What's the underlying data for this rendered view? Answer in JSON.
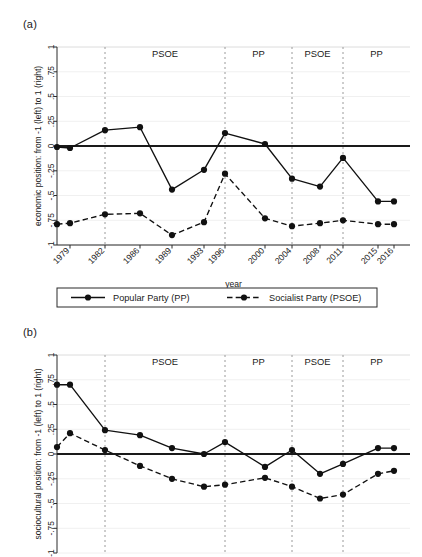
{
  "figure": {
    "panels": [
      {
        "tag": "(a)",
        "ylabel": "economic position: from -1 (left) to 1 (right)",
        "xlabel": "year"
      },
      {
        "tag": "(b)",
        "ylabel": "sociocultural position: from -1 (left) to 1 (right)",
        "xlabel": "year"
      }
    ],
    "legend": {
      "items": [
        {
          "label": "Popular Party (PP)",
          "style": "solid",
          "marker": "filled-circle"
        },
        {
          "label": "Socialist Party (PSOE)",
          "style": "dashed",
          "marker": "filled-circle"
        }
      ]
    },
    "colors": {
      "line": "#111111",
      "divider": "#9a9a9a",
      "zero": "#1a1a1a",
      "axis": "#2b2b2b"
    }
  },
  "chart_data": [
    {
      "type": "line",
      "title": "(a)",
      "xlabel": "year",
      "ylabel": "economic position: from -1 (left) to 1 (right)",
      "ylim": [
        -1,
        1
      ],
      "yticks": [
        -1,
        -0.75,
        -0.5,
        -0.25,
        0,
        0.25,
        0.5,
        0.75,
        1
      ],
      "yticklabels": [
        "-1",
        "-.75",
        "-.5",
        "-.25",
        "0",
        ".25",
        ".5",
        ".75",
        "1"
      ],
      "x": [
        1979,
        1982,
        1986,
        1989,
        1993,
        1996,
        2000,
        2004,
        2008,
        2011,
        2015,
        2016
      ],
      "xticklabels": [
        "1979",
        "1982",
        "1986",
        "1989",
        "1993",
        "1996",
        "2000",
        "2004",
        "2008",
        "2011",
        "2015",
        "2016"
      ],
      "grid": false,
      "legend_position": "below",
      "zero_line": true,
      "series": [
        {
          "name": "Popular Party (PP)",
          "style": "solid",
          "values": [
            -0.01,
            -0.02,
            0.16,
            0.19,
            -0.44,
            -0.24,
            0.13,
            0.02,
            -0.33,
            -0.41,
            -0.12,
            -0.56,
            -0.56
          ]
        },
        {
          "name": "Socialist Party (PSOE)",
          "style": "dashed",
          "values": [
            -0.79,
            -0.78,
            -0.69,
            -0.68,
            -0.9,
            -0.77,
            -0.28,
            -0.73,
            -0.81,
            -0.78,
            -0.75,
            -0.79,
            -0.79
          ]
        }
      ],
      "annotations": [
        {
          "text": "PSOE",
          "x_range": [
            1982,
            1996
          ]
        },
        {
          "text": "PP",
          "x_range": [
            1996,
            2004
          ]
        },
        {
          "text": "PSOE",
          "x_range": [
            2004,
            2011
          ]
        },
        {
          "text": "PP",
          "x_range": [
            2011,
            2016
          ]
        }
      ],
      "dividers": [
        1982,
        1996,
        2004,
        2011
      ]
    },
    {
      "type": "line",
      "title": "(b)",
      "xlabel": "year",
      "ylabel": "sociocultural position: from -1 (left) to 1 (right)",
      "ylim": [
        -1,
        1
      ],
      "yticks": [
        -1,
        -0.75,
        -0.5,
        -0.25,
        0,
        0.25,
        0.5,
        0.75,
        1
      ],
      "yticklabels": [
        "-1",
        "-.75",
        "-.5",
        "-.25",
        "0",
        ".25",
        ".5",
        ".75",
        "1"
      ],
      "x": [
        1979,
        1982,
        1986,
        1989,
        1993,
        1996,
        2000,
        2004,
        2008,
        2011,
        2015,
        2016
      ],
      "xticklabels": [
        "1979",
        "1982",
        "1986",
        "1989",
        "1993",
        "1996",
        "2000",
        "2004",
        "2008",
        "2011",
        "2015",
        "2016"
      ],
      "grid": false,
      "legend_position": "below",
      "zero_line": true,
      "series": [
        {
          "name": "Popular Party (PP)",
          "style": "solid",
          "values": [
            0.7,
            0.7,
            0.24,
            0.19,
            0.06,
            0.0,
            0.12,
            -0.13,
            0.04,
            -0.2,
            -0.1,
            0.06,
            0.06
          ]
        },
        {
          "name": "Socialist Party (PSOE)",
          "style": "dashed",
          "values": [
            0.07,
            0.21,
            0.04,
            -0.12,
            -0.25,
            -0.33,
            -0.31,
            -0.24,
            -0.33,
            -0.45,
            -0.41,
            -0.2,
            -0.17
          ]
        }
      ],
      "annotations": [
        {
          "text": "PSOE",
          "x_range": [
            1982,
            1996
          ]
        },
        {
          "text": "PP",
          "x_range": [
            1996,
            2004
          ]
        },
        {
          "text": "PSOE",
          "x_range": [
            2004,
            2011
          ]
        },
        {
          "text": "PP",
          "x_range": [
            2011,
            2016
          ]
        }
      ],
      "dividers": [
        1982,
        1996,
        2004,
        2011
      ]
    }
  ]
}
